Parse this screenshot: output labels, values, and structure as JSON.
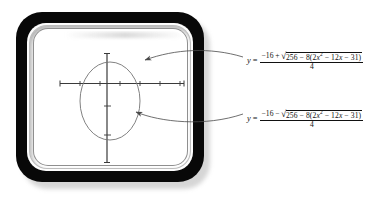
{
  "figure": {
    "type": "graphing-calculator-diagram",
    "device_label": "graphing-calculator",
    "screen_label": "calculator-screen"
  },
  "graph": {
    "curve_name": "ellipse",
    "x_axis": {
      "tick_count": 6,
      "has_arrowless_ends": true
    },
    "y_axis": {
      "tick_count": 3,
      "has_arrowless_ends": true
    }
  },
  "callouts": [
    {
      "id": "upper-branch",
      "lhs": "y",
      "equals": "=",
      "numerator_prefix": "−16",
      "sign": "+",
      "radicand_lead": "256 − 8(2",
      "radicand_var": "x",
      "radicand_exp": "2",
      "radicand_tail": " − 12",
      "radicand_var2": "x",
      "radicand_end": " − 31)",
      "denominator": "4",
      "full_text": "y = (−16 + √(256 − 8(2x² − 12x − 31)))/4"
    },
    {
      "id": "lower-branch",
      "lhs": "y",
      "equals": "=",
      "numerator_prefix": "−16",
      "sign": "−",
      "radicand_lead": "256 − 8(2",
      "radicand_var": "x",
      "radicand_exp": "2",
      "radicand_tail": " − 12",
      "radicand_var2": "x",
      "radicand_end": " − 31)",
      "denominator": "4",
      "full_text": "y = (−16 − √(256 − 8(2x² − 12x − 31)))/4"
    }
  ],
  "colors": {
    "frame": "#080808",
    "screen": "#ffffff",
    "ink": "#111111",
    "curve": "#6f6f6f",
    "axis": "#3a3a3a"
  }
}
